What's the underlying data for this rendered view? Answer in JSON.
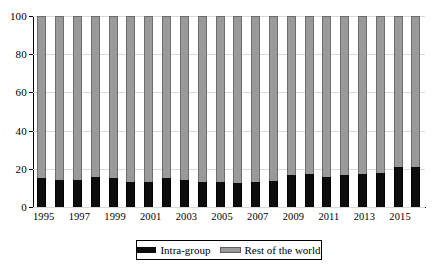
{
  "chart_data": {
    "type": "bar",
    "stacked": true,
    "stacked_normalized": true,
    "title": "",
    "subtitle": "",
    "xlabel": "",
    "ylabel": "",
    "ylim": [
      0,
      100
    ],
    "yticks": [
      0,
      20,
      40,
      60,
      80,
      100
    ],
    "ytick_labels": [
      "0",
      "20",
      "40",
      "60",
      "80",
      "100"
    ],
    "grid": true,
    "grid_axis": "y",
    "legend_position": "bottom",
    "categories": [
      "1995",
      "1996",
      "1997",
      "1998",
      "1999",
      "2000",
      "2001",
      "2002",
      "2003",
      "2004",
      "2005",
      "2006",
      "2007",
      "2008",
      "2009",
      "2010",
      "2011",
      "2012",
      "2013",
      "2014",
      "2015",
      "2016"
    ],
    "xtick_labels": [
      "1995",
      "",
      "1997",
      "",
      "1999",
      "",
      "2001",
      "",
      "2003",
      "",
      "2005",
      "",
      "2007",
      "",
      "2009",
      "",
      "2011",
      "",
      "2013",
      "",
      "2015",
      ""
    ],
    "series": [
      {
        "name": "Intra-group",
        "color": "#0d0d0d",
        "values": [
          15,
          14,
          14,
          15.5,
          15,
          13,
          13,
          15,
          14,
          13,
          13,
          12.5,
          13,
          13.5,
          17,
          17.5,
          15.5,
          17,
          17.5,
          18,
          21,
          21
        ]
      },
      {
        "name": "Rest of the world",
        "color": "#9a9a9a",
        "values": [
          85,
          86,
          86,
          84.5,
          85,
          87,
          87,
          85,
          86,
          87,
          87,
          87.5,
          87,
          86.5,
          83,
          82.5,
          84.5,
          83,
          82.5,
          82,
          79,
          79
        ]
      }
    ]
  },
  "legend": {
    "items": [
      {
        "label": "Intra-group",
        "swatch": "black"
      },
      {
        "label": "Rest of the world",
        "swatch": "grey"
      }
    ]
  },
  "colors": {
    "intra_group": "#0d0d0d",
    "rest_of_world": "#9a9a9a",
    "gridline": "#d9d9d9",
    "axis": "#000000",
    "background": "#ffffff"
  }
}
